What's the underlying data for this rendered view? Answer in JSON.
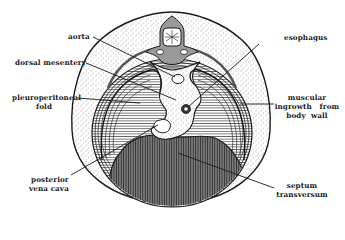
{
  "figure": {
    "colors": {
      "background": "#ffffff",
      "ink": "#1a1a1a",
      "stipple_fill": "#e9e9e9",
      "pleural_fill": "#f2f2f2",
      "septum_fill": "#6e6e6e",
      "spinal_fill": "#9a9a9a"
    }
  },
  "labels": {
    "aorta": "aorta",
    "dorsal_mesentery": "dorsal mesentery",
    "pleuroperitoneal_fold_line1": "pleuroperitoneal",
    "pleuroperitoneal_fold_line2": "fold",
    "posterior_vena_cava_line1": "posterior",
    "posterior_vena_cava_line2": "vena cava",
    "esophagus": "esophagus",
    "muscular_ingrowth_line1": "muscular",
    "muscular_ingrowth_line2": "ingrowth   from",
    "muscular_ingrowth_line3": "body  wall",
    "septum_transversum_line1": "septum",
    "septum_transversum_line2": "transversum"
  }
}
